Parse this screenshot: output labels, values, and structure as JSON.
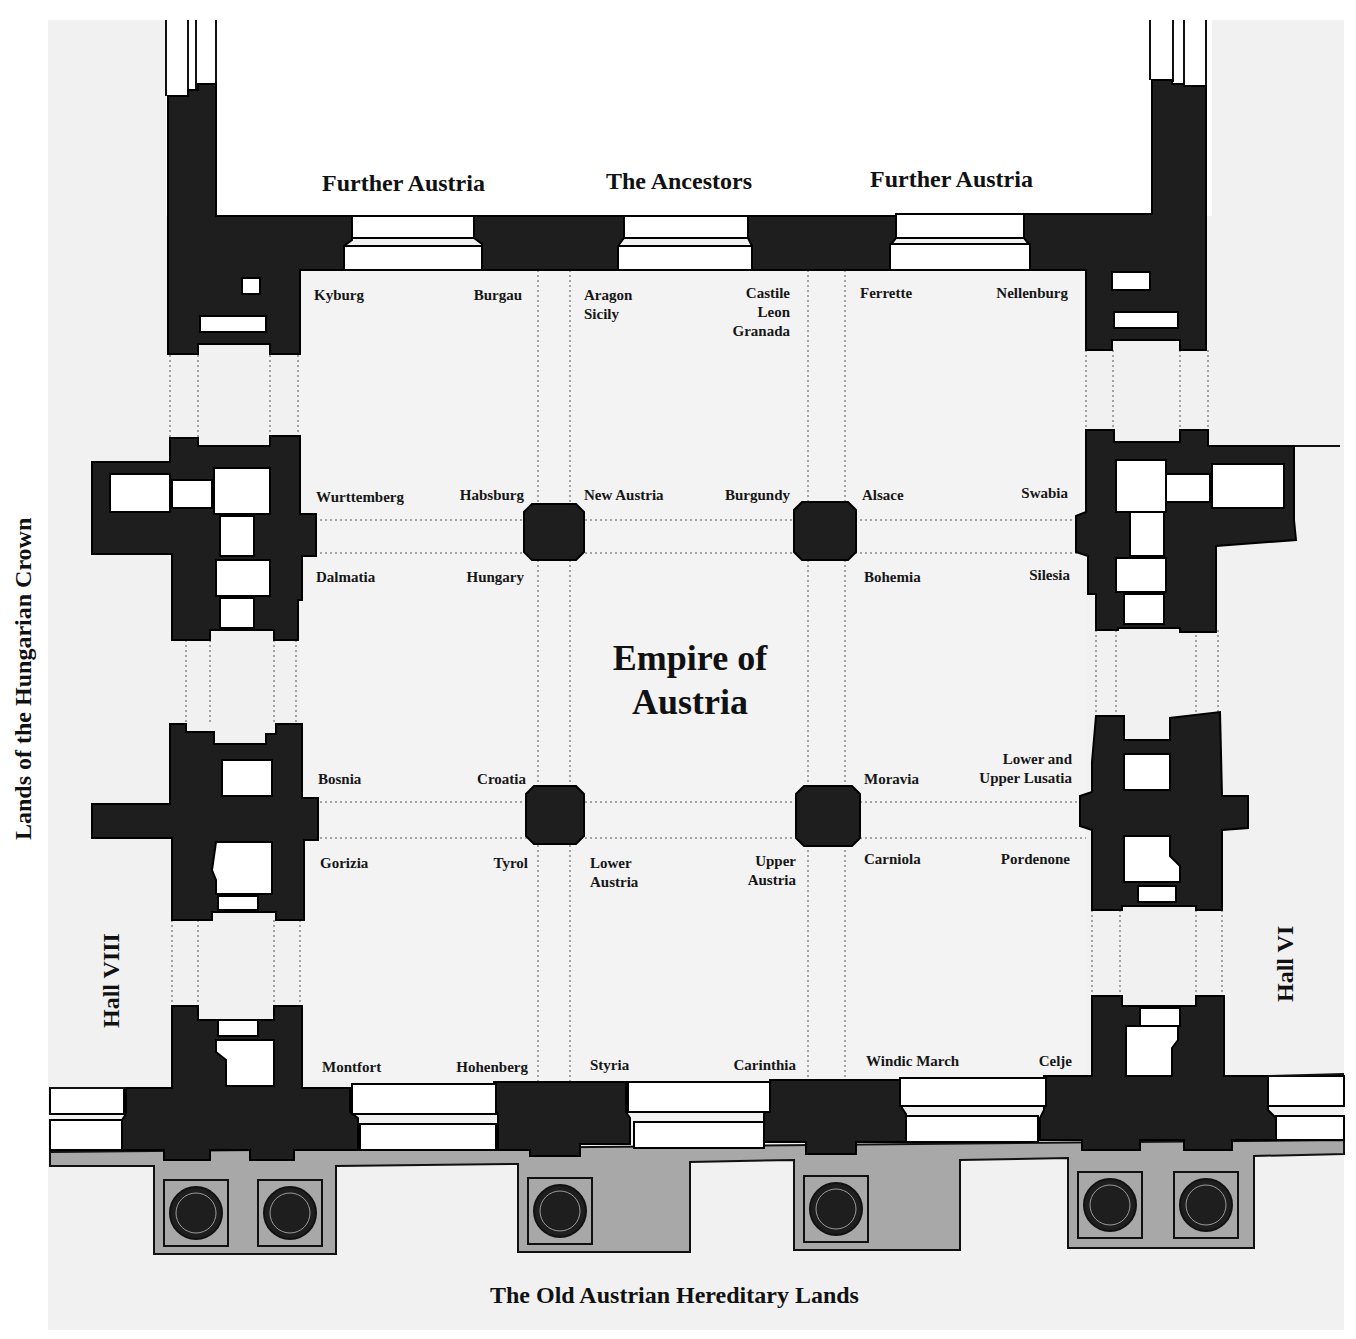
{
  "diagram": {
    "title_line1": "Empire of",
    "title_line2": "Austria",
    "colors": {
      "wall": "#1e1e1e",
      "floor": "#f1f1f1",
      "opening": "#ffffff",
      "foundation": "#a8a8a8",
      "margin": "#ffffff"
    },
    "sections": {
      "top_left": "Further Austria",
      "top_center": "The Ancestors",
      "top_right": "Further Austria",
      "bottom": "The Old Austrian Hereditary Lands",
      "left_outer": "Lands of the Hungarian Crown",
      "left_hall": "Hall VIII",
      "right_hall": "Hall VI"
    },
    "regions": {
      "kyburg": "Kyburg",
      "burgau": "Burgau",
      "aragon_sicily": [
        "Aragon",
        "Sicily"
      ],
      "castile_leon_granada": [
        "Castile",
        "Leon",
        "Granada"
      ],
      "ferrette": "Ferrette",
      "nellenburg": "Nellenburg",
      "wurttemberg": "Wurttemberg",
      "habsburg": "Habsburg",
      "new_austria": "New Austria",
      "burgundy": "Burgundy",
      "alsace": "Alsace",
      "swabia": "Swabia",
      "dalmatia": "Dalmatia",
      "hungary": "Hungary",
      "bohemia": "Bohemia",
      "silesia": "Silesia",
      "bosnia": "Bosnia",
      "croatia": "Croatia",
      "moravia": "Moravia",
      "lusatia": [
        "Lower and",
        "Upper Lusatia"
      ],
      "gorizia": "Gorizia",
      "tyrol": "Tyrol",
      "lower_austria": [
        "Lower",
        "Austria"
      ],
      "upper_austria": [
        "Upper",
        "Austria"
      ],
      "carniola": "Carniola",
      "pordenone": "Pordenone",
      "montfort": "Montfort",
      "hohenberg": "Hohenberg",
      "styria": "Styria",
      "carinthia": "Carinthia",
      "windic_march": "Windic March",
      "celje": "Celje"
    }
  }
}
